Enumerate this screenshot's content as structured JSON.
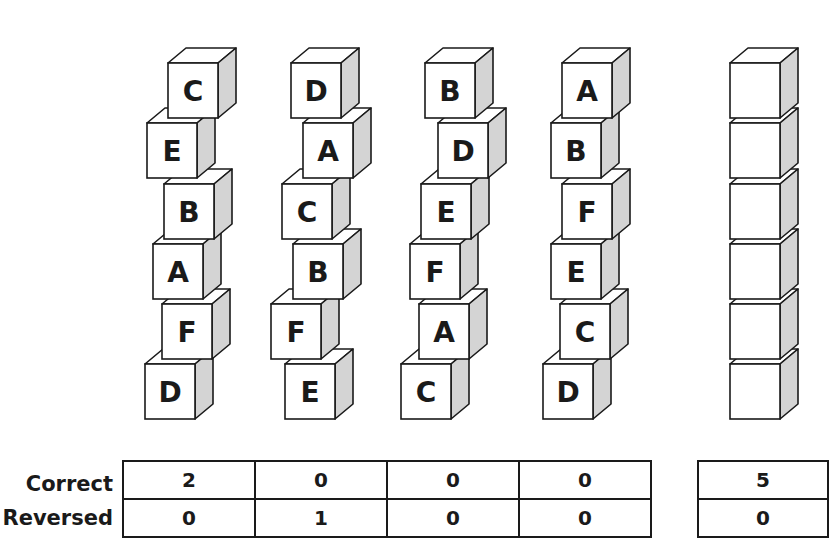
{
  "stacks": [
    {
      "name": "stack-1",
      "blocks": [
        "C",
        "E",
        "B",
        "A",
        "F",
        "D"
      ]
    },
    {
      "name": "stack-2",
      "blocks": [
        "D",
        "A",
        "C",
        "B",
        "F",
        "E"
      ]
    },
    {
      "name": "stack-3",
      "blocks": [
        "B",
        "D",
        "E",
        "F",
        "A",
        "C"
      ]
    },
    {
      "name": "stack-4",
      "blocks": [
        "A",
        "B",
        "F",
        "E",
        "C",
        "D"
      ]
    },
    {
      "name": "stack-target",
      "blocks": [
        "",
        "",
        "",
        "",
        "",
        ""
      ]
    }
  ],
  "colors": {
    "outline": "#1a1a1a",
    "face_front": "#ffffff",
    "face_top": "#ffffff",
    "face_side": "#d4d4d4"
  },
  "table": {
    "row_labels": [
      "Correct",
      "Reversed"
    ],
    "main": {
      "correct": [
        "2",
        "0",
        "0",
        "0"
      ],
      "reversed": [
        "0",
        "1",
        "0",
        "0"
      ]
    },
    "target": {
      "correct": "5",
      "reversed": "0"
    }
  }
}
